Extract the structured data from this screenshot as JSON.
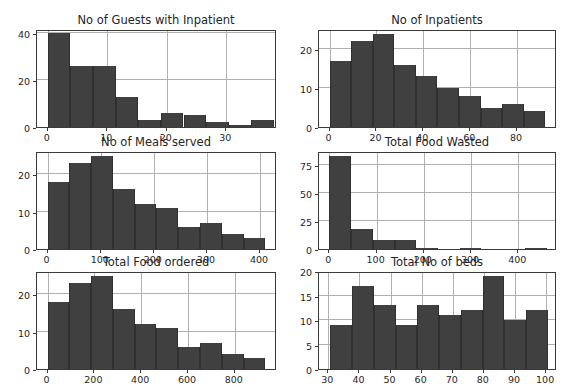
{
  "figure": {
    "width": 563,
    "height": 391,
    "background": "#ffffff",
    "bar_color": "#404040",
    "grid_color": "#b0b0b0",
    "axis_color": "#3a3a3a",
    "text_color": "#262626",
    "rows": 3,
    "cols": 2
  },
  "chart_data": [
    {
      "type": "bar",
      "subtype": "histogram",
      "title": "No of Guests with Inpatient",
      "xlabel": "",
      "ylabel": "",
      "grid": true,
      "legend": "none",
      "xlim": [
        -1.8,
        38.5
      ],
      "ylim": [
        0,
        41.8
      ],
      "xticks": [
        0,
        10,
        20,
        30
      ],
      "yticks": [
        0,
        20,
        40
      ],
      "bin_edges": [
        0.0,
        3.8,
        7.6,
        11.4,
        15.2,
        19.0,
        22.8,
        26.6,
        30.4,
        34.2,
        38.0
      ],
      "categories": [
        "0.0-3.8",
        "3.8-7.6",
        "7.6-11.4",
        "11.4-15.2",
        "15.2-19.0",
        "19.0-22.8",
        "22.8-26.6",
        "26.6-30.4",
        "30.4-34.2",
        "34.2-38.0"
      ],
      "values": [
        40,
        26,
        26,
        13,
        3,
        6,
        5,
        2,
        1,
        3
      ]
    },
    {
      "type": "bar",
      "subtype": "histogram",
      "title": "No of Inpatients",
      "xlabel": "",
      "ylabel": "",
      "grid": true,
      "legend": "none",
      "xlim": [
        -4.5,
        97.0
      ],
      "ylim": [
        0,
        25.2
      ],
      "xticks": [
        0,
        20,
        40,
        60,
        80
      ],
      "yticks": [
        0,
        10,
        20
      ],
      "bin_edges": [
        0,
        9.2,
        18.4,
        27.6,
        36.8,
        46.0,
        55.2,
        64.4,
        73.6,
        82.8,
        92.0
      ],
      "categories": [
        "0-9.2",
        "9.2-18.4",
        "18.4-27.6",
        "27.6-36.8",
        "36.8-46.0",
        "46.0-55.2",
        "55.2-64.4",
        "64.4-73.6",
        "73.6-82.8",
        "82.8-92.0"
      ],
      "values": [
        17,
        22,
        24,
        16,
        13,
        10,
        8,
        5,
        6,
        4
      ]
    },
    {
      "type": "bar",
      "subtype": "histogram",
      "title": "No of Meals served",
      "xlabel": "",
      "ylabel": "",
      "grid": true,
      "legend": "none",
      "xlim": [
        -20,
        432
      ],
      "ylim": [
        0,
        26.2
      ],
      "xticks": [
        0,
        100,
        200,
        300,
        400
      ],
      "yticks": [
        0,
        10,
        20
      ],
      "bin_edges": [
        0,
        41,
        82,
        123,
        164,
        205,
        246,
        287,
        328,
        369,
        410
      ],
      "categories": [
        "0-41",
        "41-82",
        "82-123",
        "123-164",
        "164-205",
        "205-246",
        "246-287",
        "287-328",
        "328-369",
        "369-410"
      ],
      "values": [
        18,
        23,
        25,
        16,
        12,
        11,
        6,
        7,
        4,
        3
      ]
    },
    {
      "type": "bar",
      "subtype": "histogram",
      "title": "Total Food Wasted",
      "xlabel": "",
      "ylabel": "",
      "grid": true,
      "legend": "none",
      "xlim": [
        -22,
        482
      ],
      "ylim": [
        0,
        87.0
      ],
      "xticks": [
        0,
        100,
        200,
        300,
        400
      ],
      "yticks": [
        0,
        25,
        50,
        75
      ],
      "bin_edges": [
        0,
        46,
        92,
        138,
        184,
        230,
        276,
        322,
        368,
        414,
        460
      ],
      "categories": [
        "0-46",
        "46-92",
        "92-138",
        "138-184",
        "184-230",
        "230-276",
        "276-322",
        "322-368",
        "368-414",
        "414-460"
      ],
      "values": [
        83,
        18,
        8,
        8,
        1,
        0,
        1,
        0,
        0,
        1
      ]
    },
    {
      "type": "bar",
      "subtype": "histogram",
      "title": "Total Food ordered",
      "xlabel": "",
      "ylabel": "",
      "grid": true,
      "legend": "none",
      "xlim": [
        -45,
        980
      ],
      "ylim": [
        0,
        26.2
      ],
      "xticks": [
        0,
        200,
        400,
        600,
        800
      ],
      "yticks": [
        0,
        10,
        20
      ],
      "bin_edges": [
        0,
        93,
        186,
        279,
        372,
        465,
        558,
        651,
        744,
        837,
        930
      ],
      "categories": [
        "0-93",
        "93-186",
        "186-279",
        "279-372",
        "372-465",
        "465-558",
        "558-651",
        "651-744",
        "744-837",
        "837-930"
      ],
      "values": [
        18,
        23,
        25,
        16,
        12,
        11,
        6,
        7,
        4,
        3
      ]
    },
    {
      "type": "bar",
      "subtype": "histogram",
      "title": "Total No of beds",
      "xlabel": "",
      "ylabel": "",
      "grid": true,
      "legend": "none",
      "xlim": [
        27.0,
        103.5
      ],
      "ylim": [
        0,
        20.0
      ],
      "xticks": [
        30,
        40,
        50,
        60,
        70,
        80,
        90,
        100
      ],
      "yticks": [
        0,
        5,
        10,
        15,
        20
      ],
      "bin_edges": [
        30.6,
        37.6,
        44.6,
        51.6,
        58.6,
        65.6,
        72.6,
        79.6,
        86.6,
        93.6,
        100.6
      ],
      "categories": [
        "30.6-37.6",
        "37.6-44.6",
        "44.6-51.6",
        "51.6-58.6",
        "58.6-65.6",
        "65.6-72.6",
        "72.6-79.6",
        "79.6-86.6",
        "86.6-93.6",
        "93.6-100.6"
      ],
      "values": [
        9,
        17,
        13,
        9,
        13,
        11,
        12,
        19,
        10,
        12
      ]
    }
  ]
}
